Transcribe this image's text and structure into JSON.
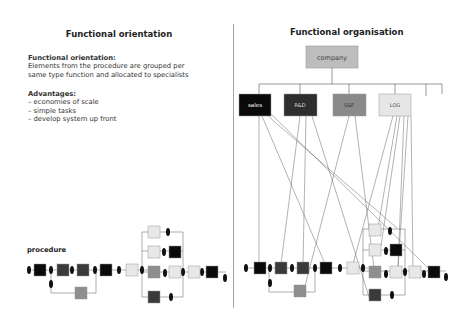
{
  "left": {
    "title": "Functional orientation",
    "definition": {
      "heading": "Functional orientation:",
      "line1": "Elements from the procedure are grouped per",
      "line2": "same type function and allocated to specialists"
    },
    "advantages": {
      "heading": "Advantages:",
      "items": [
        "– economies of scale",
        "– simple tasks",
        "– develop system up front"
      ]
    },
    "procedure_label": "procedure"
  },
  "right": {
    "title": "Functional organisation",
    "root": "company",
    "departments": [
      {
        "label": "sales",
        "color": "#0a0a0a",
        "text_color": "#ffffff"
      },
      {
        "label": "R&D",
        "color": "#2e2e2e",
        "text_color": "#dddddd"
      },
      {
        "label": "S&F",
        "color": "#8a8a8a",
        "text_color": "#333333"
      },
      {
        "label": "LOG",
        "color": "#e6e6e6",
        "text_color": "#555555"
      }
    ]
  },
  "colors": {
    "black": "#0a0a0a",
    "dark": "#3a3a3a",
    "mid": "#8e8e8e",
    "light": "#e8e8e8",
    "company": "#bdbdbd",
    "line": "#777777",
    "divider": "#888888"
  }
}
